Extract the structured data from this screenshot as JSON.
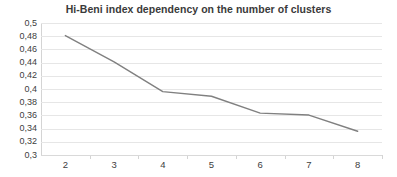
{
  "chart_data": {
    "type": "line",
    "title": "Hi-Beni index dependency on the number of clusters",
    "xlabel": "",
    "ylabel": "",
    "x": [
      2,
      3,
      4,
      5,
      6,
      7,
      8
    ],
    "categories": [
      "2",
      "3",
      "4",
      "5",
      "6",
      "7",
      "8"
    ],
    "values": [
      0.481,
      0.441,
      0.396,
      0.389,
      0.3635,
      0.3605,
      0.336
    ],
    "series": [
      {
        "name": "Hi-Beni index",
        "values": [
          0.481,
          0.441,
          0.396,
          0.389,
          0.3635,
          0.3605,
          0.336
        ]
      }
    ],
    "ylim": [
      0.3,
      0.5
    ],
    "xlim": [
      2,
      8
    ],
    "y_tick_step": 0.02,
    "y_tick_labels": [
      "0,5",
      "0,48",
      "0,46",
      "0,44",
      "0,42",
      "0,4",
      "0,38",
      "0,36",
      "0,34",
      "0,32",
      "0,3"
    ],
    "y_tick_values": [
      0.5,
      0.48,
      0.46,
      0.44,
      0.42,
      0.4,
      0.38,
      0.36,
      0.34,
      0.32,
      0.3
    ],
    "x_tick_labels": [
      "2",
      "3",
      "4",
      "5",
      "6",
      "7",
      "8"
    ],
    "grid": "horizontal",
    "legend": "none",
    "decimal_separator": ",",
    "colors": {
      "series_line": "#808080",
      "gridline": "#e6e6e6",
      "axis_line": "#d4d4d4",
      "title_text": "#3a3a3a",
      "tick_text": "#404040",
      "background": "#ffffff"
    }
  }
}
